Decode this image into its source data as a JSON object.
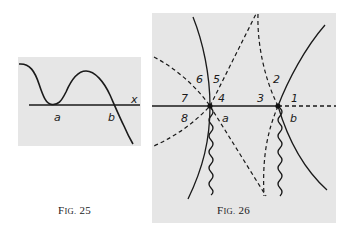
{
  "figures": [
    {
      "id": "fig25",
      "caption": "Fig. 25",
      "caption_prefix": "F",
      "caption_smallcaps": "IG.",
      "caption_number": "25",
      "panel_color": "#e6e6e6",
      "labels": {
        "x_axis": "x",
        "point_a": "a",
        "point_b": "b"
      }
    },
    {
      "id": "fig26",
      "caption": "Fig. 26",
      "caption_prefix": "F",
      "caption_smallcaps": "IG.",
      "caption_number": "26",
      "panel_color": "#e6e6e6",
      "labels": {
        "point_a": "a",
        "point_b": "b",
        "regions": [
          "1",
          "2",
          "3",
          "4",
          "5",
          "6",
          "7",
          "8"
        ]
      }
    }
  ]
}
